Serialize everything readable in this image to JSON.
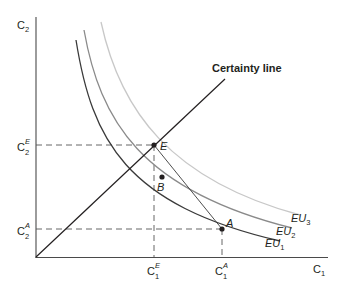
{
  "diagram": {
    "axes": {
      "x_label": "C",
      "x_label_sub": "1",
      "y_label": "C",
      "y_label_sub": "2"
    },
    "certainty_line_label": "Certainty line",
    "curves": [
      {
        "name": "EU",
        "sub": "1",
        "color": "#3a3a3a"
      },
      {
        "name": "EU",
        "sub": "2",
        "color": "#8a8a8a"
      },
      {
        "name": "EU",
        "sub": "3",
        "color": "#c8c8c8"
      }
    ],
    "points": {
      "E": "E",
      "B": "B",
      "A": "A"
    },
    "ticks": {
      "x": [
        {
          "base": "C",
          "sub": "1",
          "sup": "E"
        },
        {
          "base": "C",
          "sub": "1",
          "sup": "A"
        }
      ],
      "y": [
        {
          "base": "C",
          "sub": "2",
          "sup": "E"
        },
        {
          "base": "C",
          "sub": "2",
          "sup": "A"
        }
      ]
    },
    "colors": {
      "ink": "#231f20",
      "dashed": "#555555"
    }
  }
}
